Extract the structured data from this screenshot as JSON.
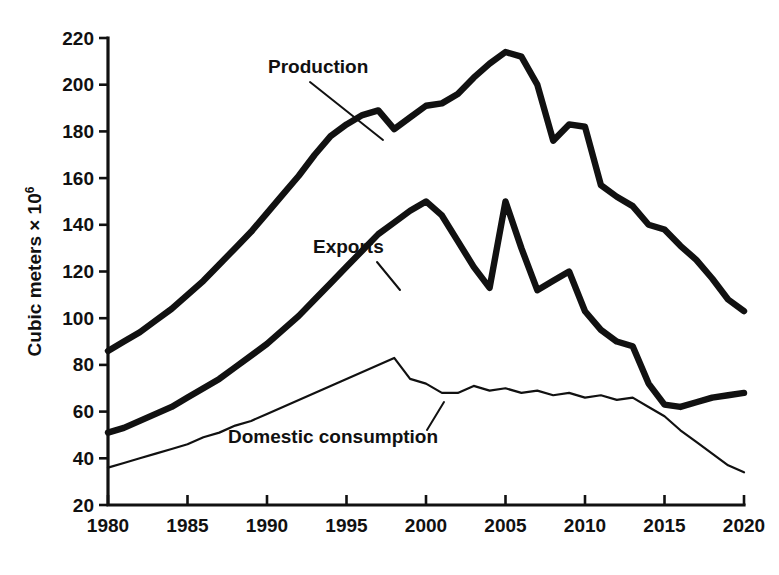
{
  "chart_data": {
    "type": "line",
    "title": "",
    "subtitle": "",
    "xlabel": "",
    "ylabel": "Cubic meters × 10⁶",
    "ylabel_base": "Cubic meters × 10",
    "ylabel_exponent": "6",
    "xlim": [
      1980,
      2020
    ],
    "ylim": [
      20,
      220
    ],
    "grid": false,
    "legend_position": "inline-annotations",
    "x_ticks": [
      1980,
      1985,
      1990,
      1995,
      2000,
      2005,
      2010,
      2015,
      2020
    ],
    "x_tick_labels": [
      "1980",
      "1985",
      "1990",
      "1995",
      "2000",
      "2005",
      "2010",
      "2015",
      "2020"
    ],
    "y_ticks": [
      20,
      40,
      60,
      80,
      100,
      120,
      140,
      160,
      180,
      200,
      220
    ],
    "y_tick_labels": [
      "20",
      "40",
      "60",
      "80",
      "100",
      "120",
      "140",
      "160",
      "180",
      "200",
      "220"
    ],
    "line_color": "#111111",
    "background_color": "#ffffff",
    "x": [
      1980,
      1981,
      1982,
      1983,
      1984,
      1985,
      1986,
      1987,
      1988,
      1989,
      1990,
      1991,
      1992,
      1993,
      1994,
      1995,
      1996,
      1997,
      1998,
      1999,
      2000,
      2001,
      2002,
      2003,
      2004,
      2005,
      2006,
      2007,
      2008,
      2009,
      2010,
      2011,
      2012,
      2013,
      2014,
      2015,
      2016,
      2017,
      2018,
      2019,
      2020
    ],
    "series": [
      {
        "name": "Production",
        "label": "Production",
        "style": "thick",
        "values": [
          86,
          90,
          94,
          99,
          104,
          110,
          116,
          123,
          130,
          137,
          145,
          153,
          161,
          170,
          178,
          183,
          187,
          189,
          181,
          186,
          191,
          192,
          196,
          203,
          209,
          214,
          212,
          200,
          176,
          183,
          182,
          157,
          152,
          148,
          140,
          138,
          131,
          125,
          117,
          108,
          103
        ]
      },
      {
        "name": "Exports",
        "label": "Exports",
        "style": "thick",
        "values": [
          51,
          53,
          56,
          59,
          62,
          66,
          70,
          74,
          79,
          84,
          89,
          95,
          101,
          108,
          115,
          122,
          129,
          136,
          141,
          146,
          150,
          144,
          133,
          122,
          113,
          150,
          130,
          112,
          116,
          120,
          103,
          95,
          90,
          88,
          72,
          63,
          62,
          64,
          66,
          67,
          68
        ]
      },
      {
        "name": "Domestic consumption",
        "label": "Domestic consumption",
        "style": "thin",
        "values": [
          36,
          38,
          40,
          42,
          44,
          46,
          49,
          51,
          54,
          56,
          59,
          62,
          65,
          68,
          71,
          74,
          77,
          80,
          83,
          74,
          72,
          68,
          68,
          71,
          69,
          70,
          68,
          69,
          67,
          68,
          66,
          67,
          65,
          66,
          62,
          58,
          52,
          47,
          42,
          37,
          34
        ]
      }
    ],
    "annotations": [
      {
        "name": "production-annotation",
        "text": "Production",
        "text_x": 268,
        "text_y": 73,
        "leader_from_x": 310,
        "leader_from_y": 82,
        "leader_to_x": 383,
        "leader_to_y": 140
      },
      {
        "name": "exports-annotation",
        "text": "Exports",
        "text_x": 313,
        "text_y": 253,
        "leader_from_x": 377,
        "leader_from_y": 262,
        "leader_to_x": 400,
        "leader_to_y": 290
      },
      {
        "name": "domestic-consumption-annotation",
        "text": "Domestic consumption",
        "text_x": 228,
        "text_y": 443,
        "leader_from_x": 427,
        "leader_from_y": 430,
        "leader_to_x": 444,
        "leader_to_y": 402
      }
    ]
  },
  "figure": {
    "plot_left_px": 108,
    "plot_right_px": 744,
    "plot_top_px": 38,
    "plot_bottom_px": 505
  }
}
